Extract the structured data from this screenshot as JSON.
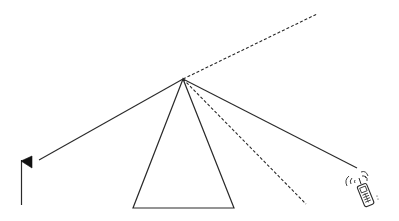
{
  "diagram": {
    "background": "#ffffff",
    "stroke_color": "#2a2a2a",
    "apex": {
      "x": 183,
      "y": 79
    },
    "triangle": {
      "points": [
        [
          183,
          79
        ],
        [
          133,
          208
        ],
        [
          234,
          208
        ]
      ]
    },
    "lines": [
      {
        "name": "dashed-line-upper",
        "style": "dashed",
        "from": [
          183,
          79
        ],
        "to": [
          317,
          14
        ]
      },
      {
        "name": "dashed-line-lower",
        "style": "dashed",
        "from": [
          183,
          79
        ],
        "to": [
          306,
          204
        ]
      },
      {
        "name": "solid-line-to-phone",
        "style": "solid",
        "from": [
          183,
          79
        ],
        "to": [
          357,
          168
        ]
      },
      {
        "name": "solid-line-to-flag",
        "style": "solid",
        "from": [
          183,
          79
        ],
        "to": [
          39,
          160
        ]
      }
    ],
    "icons": [
      {
        "name": "flag-icon",
        "x": 21,
        "y": 156
      },
      {
        "name": "mobile-phone-icon",
        "x": 347,
        "y": 175
      }
    ]
  }
}
